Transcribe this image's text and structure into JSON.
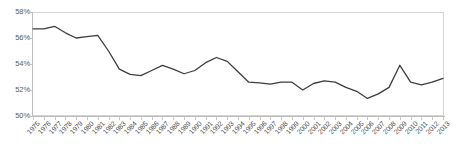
{
  "chart_data": {
    "type": "line",
    "title": "",
    "subtitle": "",
    "xlabel": "",
    "ylabel": "",
    "ylim": [
      50,
      58
    ],
    "yticks": [
      50,
      52,
      54,
      56,
      58
    ],
    "ytick_labels": [
      "50%",
      "52%",
      "54%",
      "56%",
      "58%"
    ],
    "grid": false,
    "legend": null,
    "legend_position": "none",
    "line_color": "#3d3d3d",
    "categories": [
      "1975",
      "1976",
      "1977",
      "1978",
      "1979",
      "1980",
      "1981",
      "1982",
      "1983",
      "1984",
      "1985",
      "1986",
      "1987",
      "1988",
      "1989",
      "1990",
      "1991",
      "1992",
      "1993",
      "1994",
      "1995",
      "1996",
      "1997",
      "1998",
      "1999",
      "2000",
      "2001",
      "2002",
      "2003",
      "2004",
      "2005",
      "2006",
      "2007",
      "2008",
      "2009",
      "2010",
      "2011",
      "2012",
      "2013"
    ],
    "values": [
      56.7,
      56.7,
      56.9,
      56.4,
      56.0,
      56.1,
      56.2,
      55.0,
      53.6,
      53.2,
      53.1,
      53.5,
      53.9,
      53.6,
      53.25,
      53.5,
      54.1,
      54.5,
      54.2,
      53.4,
      52.6,
      52.55,
      52.45,
      52.6,
      52.6,
      52.0,
      52.5,
      52.7,
      52.6,
      52.2,
      51.9,
      51.35,
      51.7,
      52.2,
      53.9,
      52.6,
      52.4,
      52.6,
      52.9
    ],
    "values_unit": "%",
    "xtick_labels": [
      "1975",
      "1976",
      "1977",
      "1978",
      "1979",
      "1980",
      "1981",
      "1982",
      "1983",
      "1984",
      "1985",
      "1986",
      "1987",
      "1988",
      "1989",
      "1990",
      "1991",
      "1992",
      "1993",
      "1994",
      "1995",
      "1996",
      "1997",
      "1998",
      "1999",
      "2000",
      "2001",
      "2002",
      "2003",
      "2004",
      "2005",
      "2006",
      "2007",
      "2008",
      "2009",
      "2010",
      "2011",
      "2012",
      "2013"
    ]
  }
}
